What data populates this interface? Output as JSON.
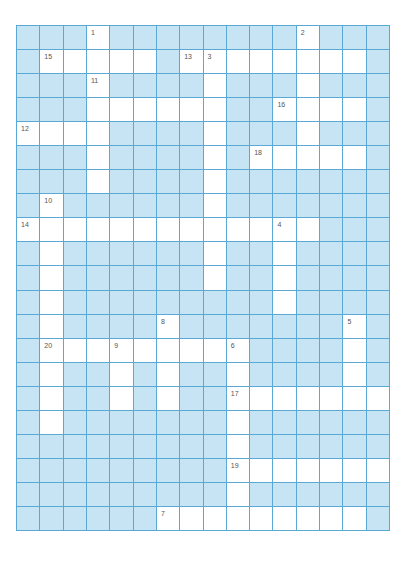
{
  "puzzle": {
    "columns": 16,
    "rows": 21,
    "colors": {
      "blocked_cell": "#c6e4f3",
      "open_cell": "#ffffff",
      "grid_line": "#5aa9d4",
      "number_text": "#555555"
    },
    "grid": [
      "...W........W...",
      ".WWWWW.WWWWWWWW.",
      "...W....W...W...",
      "...WWWWWW..WWWW.",
      "WWWW....W...W...",
      "...W....W.WWWWW.",
      "...W....W.......",
      ".W......W.......",
      "WWWWWWWWWWWWW...",
      ".W......W..W....",
      ".W......W..W....",
      ".W.........W....",
      ".W....W.......W.",
      ".WWWWWWWWW....W.",
      ".W..W.W..W....W.",
      ".W..W.W..WWWWWWW",
      ".W.......W......",
      ".........W......",
      ".........WWWWWWW",
      ".........W......",
      "......WWWWWWWWW."
    ],
    "clue_numbers": [
      {
        "number": "1",
        "row": 0,
        "col": 3
      },
      {
        "number": "2",
        "row": 0,
        "col": 12
      },
      {
        "number": "15",
        "row": 1,
        "col": 1
      },
      {
        "number": "13",
        "row": 1,
        "col": 7
      },
      {
        "number": "3",
        "row": 1,
        "col": 8
      },
      {
        "number": "11",
        "row": 2,
        "col": 3
      },
      {
        "number": "16",
        "row": 3,
        "col": 11
      },
      {
        "number": "12",
        "row": 4,
        "col": 0
      },
      {
        "number": "18",
        "row": 5,
        "col": 10
      },
      {
        "number": "10",
        "row": 7,
        "col": 1
      },
      {
        "number": "14",
        "row": 8,
        "col": 0
      },
      {
        "number": "4",
        "row": 8,
        "col": 11
      },
      {
        "number": "8",
        "row": 12,
        "col": 6
      },
      {
        "number": "5",
        "row": 12,
        "col": 14
      },
      {
        "number": "20",
        "row": 13,
        "col": 1
      },
      {
        "number": "9",
        "row": 13,
        "col": 4
      },
      {
        "number": "6",
        "row": 13,
        "col": 9
      },
      {
        "number": "17",
        "row": 15,
        "col": 9
      },
      {
        "number": "19",
        "row": 18,
        "col": 9
      },
      {
        "number": "7",
        "row": 20,
        "col": 6
      }
    ]
  }
}
